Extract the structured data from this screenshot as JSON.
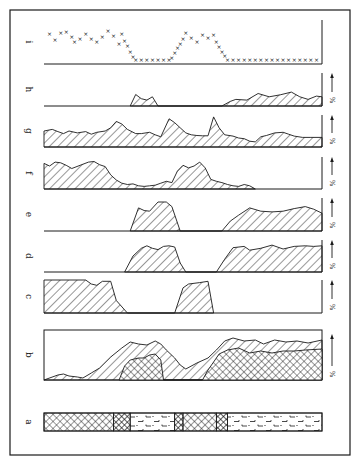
{
  "figure": {
    "frame": {
      "x": 10,
      "y": 10,
      "w": 340,
      "h": 445
    },
    "plot_x0": 44,
    "plot_x1": 322,
    "ink": "#1a1a1a",
    "unit_label": "%"
  },
  "chart_data": {
    "type": "area",
    "title": "",
    "xlabel": "",
    "ylabel": "%",
    "x_domain": [
      0,
      100
    ],
    "grid": false,
    "legend": "none",
    "panels": [
      {
        "id": "i",
        "label": "i",
        "kind": "markers",
        "baseline": 64,
        "height": 44,
        "has_pct_axis": false,
        "points": [
          [
            2,
            70
          ],
          [
            4,
            55
          ],
          [
            6,
            73
          ],
          [
            8,
            76
          ],
          [
            10,
            63
          ],
          [
            11,
            48
          ],
          [
            13,
            57
          ],
          [
            15,
            70
          ],
          [
            17,
            58
          ],
          [
            19,
            50
          ],
          [
            21,
            62
          ],
          [
            23,
            77
          ],
          [
            25,
            65
          ],
          [
            27,
            45
          ],
          [
            28,
            70
          ],
          [
            29,
            52
          ],
          [
            30,
            38
          ],
          [
            31,
            22
          ],
          [
            32,
            10
          ],
          [
            33,
            3
          ],
          [
            35,
            1
          ],
          [
            37,
            1
          ],
          [
            39,
            1
          ],
          [
            41,
            1
          ],
          [
            43,
            1
          ],
          [
            45,
            1
          ],
          [
            46,
            8
          ],
          [
            47,
            20
          ],
          [
            48,
            32
          ],
          [
            49,
            45
          ],
          [
            50,
            57
          ],
          [
            51,
            72
          ],
          [
            53,
            60
          ],
          [
            55,
            48
          ],
          [
            57,
            68
          ],
          [
            59,
            60
          ],
          [
            61,
            68
          ],
          [
            62,
            48
          ],
          [
            63,
            35
          ],
          [
            64,
            22
          ],
          [
            65,
            12
          ],
          [
            66,
            3
          ],
          [
            68,
            3
          ],
          [
            70,
            3
          ],
          [
            72,
            3
          ],
          [
            74,
            3
          ],
          [
            76,
            3
          ],
          [
            78,
            3
          ],
          [
            80,
            3
          ],
          [
            82,
            3
          ],
          [
            84,
            3
          ],
          [
            86,
            3
          ],
          [
            88,
            3
          ],
          [
            90,
            3
          ],
          [
            92,
            3
          ],
          [
            94,
            3
          ],
          [
            96,
            3
          ],
          [
            98,
            3
          ]
        ]
      },
      {
        "id": "h",
        "label": "h",
        "kind": "hatch",
        "baseline": 106,
        "height": 33,
        "has_pct_axis": true,
        "points": [
          [
            31,
            0
          ],
          [
            33,
            35
          ],
          [
            35,
            22
          ],
          [
            37,
            18
          ],
          [
            39,
            28
          ],
          [
            41,
            0
          ],
          [
            64,
            0
          ],
          [
            67,
            14
          ],
          [
            69,
            20
          ],
          [
            73,
            18
          ],
          [
            77,
            38
          ],
          [
            81,
            28
          ],
          [
            85,
            34
          ],
          [
            89,
            42
          ],
          [
            92,
            28
          ],
          [
            95,
            20
          ],
          [
            98,
            30
          ],
          [
            100,
            28
          ],
          [
            100,
            0
          ]
        ]
      },
      {
        "id": "g",
        "label": "g",
        "kind": "hatch",
        "baseline": 147,
        "height": 32,
        "has_pct_axis": true,
        "points": [
          [
            0,
            0
          ],
          [
            0,
            50
          ],
          [
            3,
            55
          ],
          [
            5,
            48
          ],
          [
            7,
            42
          ],
          [
            9,
            50
          ],
          [
            12,
            44
          ],
          [
            15,
            48
          ],
          [
            17,
            40
          ],
          [
            19,
            46
          ],
          [
            22,
            50
          ],
          [
            24,
            60
          ],
          [
            26,
            80
          ],
          [
            28,
            72
          ],
          [
            30,
            55
          ],
          [
            33,
            42
          ],
          [
            35,
            42
          ],
          [
            38,
            46
          ],
          [
            40,
            38
          ],
          [
            42,
            32
          ],
          [
            45,
            88
          ],
          [
            47,
            76
          ],
          [
            49,
            60
          ],
          [
            51,
            44
          ],
          [
            53,
            38
          ],
          [
            55,
            36
          ],
          [
            57,
            35
          ],
          [
            59,
            35
          ],
          [
            61,
            94
          ],
          [
            63,
            60
          ],
          [
            65,
            38
          ],
          [
            68,
            34
          ],
          [
            70,
            28
          ],
          [
            72,
            26
          ],
          [
            74,
            18
          ],
          [
            76,
            16
          ],
          [
            78,
            32
          ],
          [
            80,
            36
          ],
          [
            83,
            44
          ],
          [
            86,
            46
          ],
          [
            88,
            40
          ],
          [
            90,
            34
          ],
          [
            93,
            30
          ],
          [
            96,
            30
          ],
          [
            100,
            30
          ],
          [
            100,
            0
          ]
        ]
      },
      {
        "id": "f",
        "label": "f",
        "kind": "hatch",
        "baseline": 189,
        "height": 32,
        "has_pct_axis": true,
        "points": [
          [
            0,
            0
          ],
          [
            0,
            80
          ],
          [
            2,
            72
          ],
          [
            4,
            84
          ],
          [
            6,
            82
          ],
          [
            8,
            74
          ],
          [
            10,
            64
          ],
          [
            13,
            74
          ],
          [
            16,
            84
          ],
          [
            18,
            86
          ],
          [
            20,
            76
          ],
          [
            22,
            70
          ],
          [
            24,
            44
          ],
          [
            26,
            28
          ],
          [
            28,
            18
          ],
          [
            30,
            14
          ],
          [
            32,
            16
          ],
          [
            34,
            10
          ],
          [
            36,
            8
          ],
          [
            38,
            10
          ],
          [
            40,
            12
          ],
          [
            42,
            18
          ],
          [
            44,
            24
          ],
          [
            46,
            20
          ],
          [
            48,
            56
          ],
          [
            50,
            74
          ],
          [
            52,
            66
          ],
          [
            54,
            72
          ],
          [
            56,
            84
          ],
          [
            58,
            66
          ],
          [
            60,
            30
          ],
          [
            62,
            24
          ],
          [
            64,
            20
          ],
          [
            66,
            14
          ],
          [
            68,
            10
          ],
          [
            70,
            8
          ],
          [
            72,
            14
          ],
          [
            74,
            10
          ],
          [
            76,
            0
          ]
        ]
      },
      {
        "id": "e",
        "label": "e",
        "kind": "hatch",
        "baseline": 231,
        "height": 33,
        "has_pct_axis": true,
        "points": [
          [
            31,
            0
          ],
          [
            34,
            70
          ],
          [
            36,
            62
          ],
          [
            38,
            60
          ],
          [
            41,
            88
          ],
          [
            44,
            88
          ],
          [
            46,
            74
          ],
          [
            49,
            0
          ],
          [
            64,
            0
          ],
          [
            67,
            30
          ],
          [
            70,
            48
          ],
          [
            74,
            70
          ],
          [
            78,
            60
          ],
          [
            82,
            58
          ],
          [
            86,
            60
          ],
          [
            90,
            68
          ],
          [
            94,
            74
          ],
          [
            97,
            66
          ],
          [
            100,
            54
          ],
          [
            100,
            0
          ]
        ]
      },
      {
        "id": "d",
        "label": "d",
        "kind": "hatch",
        "baseline": 272,
        "height": 32,
        "has_pct_axis": true,
        "points": [
          [
            29,
            0
          ],
          [
            32,
            50
          ],
          [
            35,
            74
          ],
          [
            37,
            82
          ],
          [
            39,
            74
          ],
          [
            41,
            70
          ],
          [
            43,
            80
          ],
          [
            45,
            82
          ],
          [
            47,
            78
          ],
          [
            49,
            28
          ],
          [
            51,
            0
          ],
          [
            62,
            0
          ],
          [
            65,
            40
          ],
          [
            68,
            76
          ],
          [
            72,
            80
          ],
          [
            74,
            68
          ],
          [
            78,
            74
          ],
          [
            82,
            84
          ],
          [
            86,
            72
          ],
          [
            90,
            80
          ],
          [
            94,
            82
          ],
          [
            97,
            80
          ],
          [
            100,
            82
          ],
          [
            100,
            0
          ]
        ]
      },
      {
        "id": "c",
        "label": "c",
        "kind": "hatch",
        "baseline": 313,
        "height": 33,
        "has_pct_axis": true,
        "points": [
          [
            0,
            0
          ],
          [
            0,
            100
          ],
          [
            15,
            100
          ],
          [
            17,
            88
          ],
          [
            19,
            84
          ],
          [
            21,
            96
          ],
          [
            24,
            96
          ],
          [
            26,
            38
          ],
          [
            30,
            0
          ],
          [
            47,
            0
          ],
          [
            50,
            76
          ],
          [
            52,
            88
          ],
          [
            56,
            92
          ],
          [
            59,
            96
          ],
          [
            61,
            0
          ]
        ]
      },
      {
        "id": "b",
        "label": "b",
        "kind": "stacked",
        "box_top": 330,
        "baseline": 380,
        "height": 50,
        "has_pct_axis": true,
        "outer": [
          [
            0,
            0
          ],
          [
            5,
            10
          ],
          [
            7,
            12
          ],
          [
            9,
            8
          ],
          [
            12,
            6
          ],
          [
            14,
            4
          ],
          [
            17,
            14
          ],
          [
            20,
            24
          ],
          [
            24,
            46
          ],
          [
            28,
            64
          ],
          [
            31,
            76
          ],
          [
            34,
            72
          ],
          [
            37,
            70
          ],
          [
            40,
            78
          ],
          [
            42,
            72
          ],
          [
            44,
            60
          ],
          [
            47,
            44
          ],
          [
            49,
            30
          ],
          [
            51,
            22
          ],
          [
            55,
            34
          ],
          [
            59,
            44
          ],
          [
            62,
            60
          ],
          [
            65,
            78
          ],
          [
            68,
            84
          ],
          [
            72,
            78
          ],
          [
            76,
            80
          ],
          [
            79,
            72
          ],
          [
            83,
            80
          ],
          [
            87,
            76
          ],
          [
            91,
            78
          ],
          [
            95,
            74
          ],
          [
            100,
            80
          ],
          [
            100,
            0
          ]
        ],
        "inner": [
          [
            27,
            0
          ],
          [
            29,
            28
          ],
          [
            31,
            40
          ],
          [
            34,
            44
          ],
          [
            36,
            44
          ],
          [
            38,
            50
          ],
          [
            40,
            52
          ],
          [
            42,
            40
          ],
          [
            43,
            0
          ],
          [
            57,
            0
          ],
          [
            59,
            20
          ],
          [
            61,
            36
          ],
          [
            63,
            52
          ],
          [
            66,
            60
          ],
          [
            70,
            64
          ],
          [
            74,
            54
          ],
          [
            78,
            58
          ],
          [
            82,
            54
          ],
          [
            86,
            58
          ],
          [
            90,
            58
          ],
          [
            94,
            60
          ],
          [
            100,
            62
          ],
          [
            100,
            0
          ]
        ]
      },
      {
        "id": "a",
        "label": "a",
        "kind": "lithology",
        "top": 413,
        "bottom": 431,
        "segments": [
          {
            "from": 0,
            "to": 25,
            "pattern": "crosshatch"
          },
          {
            "from": 25,
            "to": 31,
            "pattern": "crosshatch-bold"
          },
          {
            "from": 31,
            "to": 47,
            "pattern": "peat-dashes"
          },
          {
            "from": 47,
            "to": 50,
            "pattern": "crosshatch-bold"
          },
          {
            "from": 50,
            "to": 62,
            "pattern": "crosshatch"
          },
          {
            "from": 62,
            "to": 66,
            "pattern": "crosshatch-bold"
          },
          {
            "from": 66,
            "to": 100,
            "pattern": "peat-dashes"
          }
        ]
      }
    ]
  }
}
